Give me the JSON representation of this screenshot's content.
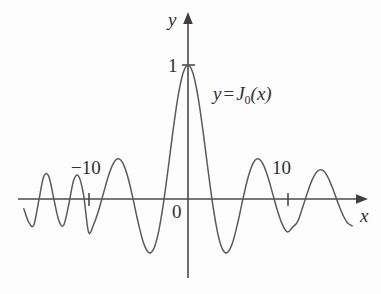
{
  "figure": {
    "background_color": "#fdfdfd",
    "curve_color": "#5a5a5a",
    "axis_color": "#4a4a4a"
  },
  "axes": {
    "y_axis_label": "y",
    "x_axis_label": "x",
    "origin_label": "0",
    "y_tick_label": "1",
    "x_tick_left_label": "−10",
    "x_tick_right_label": "10"
  },
  "equation": {
    "lhs": "y",
    "operator": "=",
    "function_name": "J",
    "subscript": "0",
    "argument": "(x)",
    "full_text": "y = J₀(x)"
  },
  "chart_data": {
    "type": "line",
    "title": "",
    "subtitle": "",
    "xlabel": "x",
    "ylabel": "y",
    "function": "J0",
    "annotations": [
      "y = J₀(x)"
    ],
    "legend": [],
    "legend_position": "none",
    "grid": false,
    "xlim": [
      -16.5,
      16.8
    ],
    "ylim": [
      -0.55,
      1.15
    ],
    "xticks": [
      -10,
      10
    ],
    "xtick_labels": [
      "−10",
      "10"
    ],
    "yticks": [
      1
    ],
    "ytick_labels": [
      "1"
    ],
    "axis_arrows": [
      "x-positive",
      "y-positive"
    ],
    "series": [
      {
        "name": "J0(x)",
        "color": "#5a5a5a",
        "x": [
          -16.5,
          -16.0,
          -15.5,
          -15.0,
          -14.5,
          -14.0,
          -13.5,
          -13.0,
          -12.5,
          -12.0,
          -11.5,
          -11.0,
          -10.5,
          -10.0,
          -9.5,
          -9.0,
          -8.5,
          -8.0,
          -7.5,
          -7.0,
          -6.5,
          -6.0,
          -5.5,
          -5.0,
          -4.5,
          -4.0,
          -3.5,
          -3.0,
          -2.5,
          -2.0,
          -1.5,
          -1.0,
          -0.5,
          0.0,
          0.5,
          1.0,
          1.5,
          2.0,
          2.5,
          3.0,
          3.5,
          4.0,
          4.5,
          5.0,
          5.5,
          6.0,
          6.5,
          7.0,
          7.5,
          8.0,
          8.5,
          9.0,
          9.5,
          10.0,
          10.5,
          11.0,
          11.5,
          12.0,
          12.5,
          13.0,
          13.5,
          14.0,
          14.5,
          15.0,
          15.5,
          16.0,
          16.5
        ],
        "y": [
          -0.073,
          -0.175,
          -0.194,
          -0.014,
          0.168,
          0.171,
          0.007,
          -0.157,
          -0.197,
          -0.048,
          0.138,
          0.171,
          0.032,
          -0.246,
          -0.193,
          -0.09,
          0.042,
          0.172,
          0.266,
          0.3,
          0.26,
          0.151,
          -0.007,
          -0.178,
          -0.321,
          -0.397,
          -0.38,
          -0.26,
          -0.048,
          0.224,
          0.512,
          0.765,
          0.938,
          1.0,
          0.938,
          0.765,
          0.512,
          0.224,
          -0.048,
          -0.26,
          -0.38,
          -0.397,
          -0.321,
          -0.178,
          -0.007,
          0.151,
          0.26,
          0.3,
          0.266,
          0.172,
          0.042,
          -0.09,
          -0.193,
          -0.246,
          -0.211,
          -0.171,
          -0.068,
          0.047,
          0.146,
          0.207,
          0.215,
          0.171,
          0.087,
          -0.014,
          -0.108,
          -0.175,
          -0.201
        ]
      }
    ]
  }
}
